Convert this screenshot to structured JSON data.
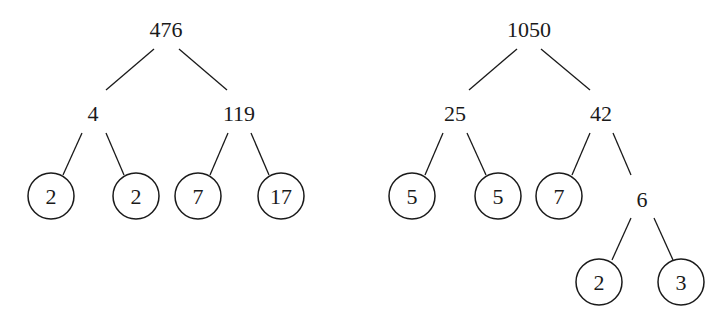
{
  "diagram": {
    "type": "factor-trees",
    "trees": [
      {
        "root": "476",
        "level1": [
          "4",
          "119"
        ],
        "leaves": [
          "2",
          "2",
          "7",
          "17"
        ]
      },
      {
        "root": "1050",
        "level1": [
          "25",
          "42"
        ],
        "level2_left_leaves": [
          "5",
          "5"
        ],
        "level2_right": [
          "7",
          "6"
        ],
        "level3_leaves": [
          "2",
          "3"
        ]
      }
    ],
    "circled_primes_note": "Circled numbers are prime factors"
  }
}
